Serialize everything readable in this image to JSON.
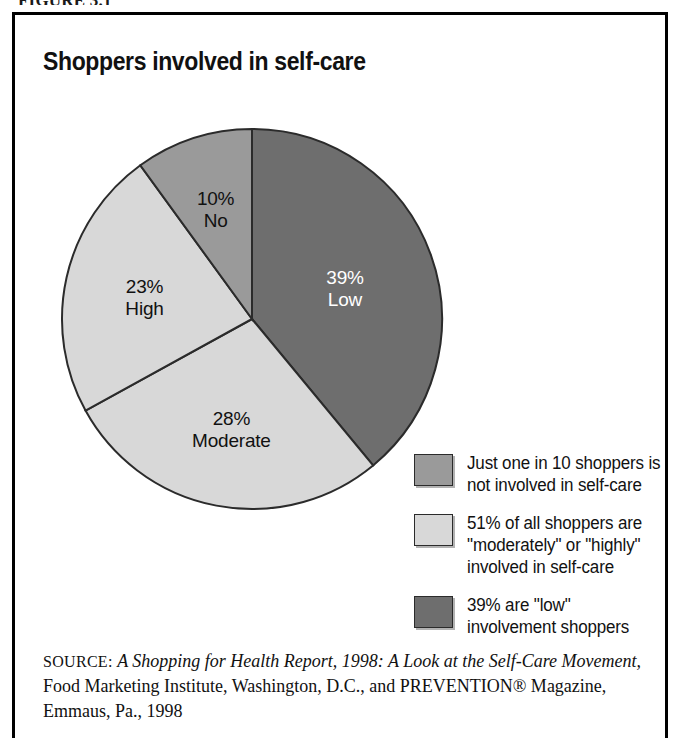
{
  "figure": {
    "label": "FIGURE 3.1"
  },
  "chart_title": "Shoppers involved in self-care",
  "chart_data": {
    "type": "pie",
    "title": "Shoppers involved in self-care",
    "xlabel": "",
    "ylabel": "",
    "legend_position": "right",
    "grid": false,
    "categories": [
      "Low",
      "Moderate",
      "High",
      "No"
    ],
    "values": [
      39,
      28,
      23,
      10
    ],
    "unit": "percent",
    "start_angle_deg": 0,
    "direction": "clockwise",
    "slices": [
      {
        "name": "Low",
        "value": 39,
        "percent_label": "39%",
        "category_label": "Low",
        "color": "#6e6e6e",
        "text_color": "#ffffff",
        "start_deg": 0,
        "end_deg": 140.4
      },
      {
        "name": "Moderate",
        "value": 28,
        "percent_label": "28%",
        "category_label": "Moderate",
        "color": "#d8d8d8",
        "text_color": "#111111",
        "start_deg": 140.4,
        "end_deg": 241.2
      },
      {
        "name": "High",
        "value": 23,
        "percent_label": "23%",
        "category_label": "High",
        "color": "#d8d8d8",
        "text_color": "#111111",
        "start_deg": 241.2,
        "end_deg": 324.0
      },
      {
        "name": "No",
        "value": 10,
        "percent_label": "10%",
        "category_label": "No",
        "color": "#9a9a9a",
        "text_color": "#111111",
        "start_deg": 324.0,
        "end_deg": 360.0
      }
    ],
    "annotations": [
      "Just one in 10 shoppers is not involved in self-care",
      "51% of all shoppers are \"moderately\" or \"highly\" involved in self-care",
      "39% are \"low\" involvement shoppers"
    ]
  },
  "legend": {
    "items": [
      {
        "color": "#9a9a9a",
        "line1": "Just one in 10 shoppers is",
        "line2": "not involved in self-care",
        "line3": ""
      },
      {
        "color": "#d8d8d8",
        "line1": "51% of all shoppers are",
        "line2": "\"moderately\" or \"highly\"",
        "line3": "involved in self-care"
      },
      {
        "color": "#6e6e6e",
        "line1": "39% are \"low\"",
        "line2": "involvement shoppers",
        "line3": ""
      }
    ]
  },
  "source": {
    "label": "SOURCE:",
    "title_italic_1": "A Shopping for Health Report, 1998: A Look at the Self-Care",
    "title_italic_2": "Movement,",
    "rest_1": " Food Marketing Institute, Washington, D.C., and",
    "rest_2": "PREVENTION® Magazine, Emmaus, Pa., 1998"
  },
  "colors": {
    "slice_dark": "#6e6e6e",
    "slice_medium": "#9a9a9a",
    "slice_light": "#d8d8d8",
    "outline": "#2b2b2b",
    "frame": "#000000",
    "background": "#ffffff"
  }
}
